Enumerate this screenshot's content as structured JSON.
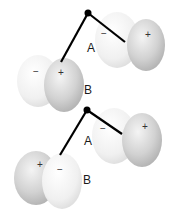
{
  "diagram": {
    "top": {
      "label_a": "A",
      "label_b": "B",
      "orbital_a": {
        "left_sign": "−",
        "right_sign": "+"
      },
      "orbital_b": {
        "left_sign": "−",
        "right_sign": "+"
      }
    },
    "bottom": {
      "label_a": "A",
      "label_b": "B",
      "orbital_a": {
        "left_sign": "−",
        "right_sign": "+"
      },
      "orbital_b": {
        "left_sign": "+",
        "right_sign": "−"
      }
    },
    "colors": {
      "light_lobe": "#f2f2f2",
      "dark_lobe": "#c8c8c8",
      "bond": "#000000"
    }
  }
}
